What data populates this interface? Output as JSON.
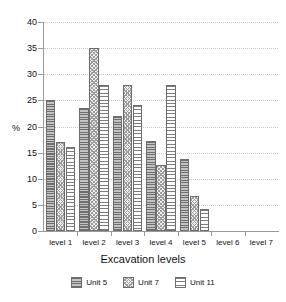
{
  "chart_data": {
    "type": "bar",
    "title": "",
    "subtitle": "",
    "xlabel": "Excavation levels",
    "ylabel": "%",
    "categories": [
      "level 1",
      "level 2",
      "level 3",
      "level 4",
      "level 5",
      "level 6",
      "level 7"
    ],
    "series": [
      {
        "name": "Unit 5",
        "values": [
          25.1,
          23.6,
          22.1,
          17.2,
          13.7,
          0,
          0
        ],
        "pattern": "dark-horizontal-lines",
        "color": "#8c8c8c"
      },
      {
        "name": "Unit 7",
        "values": [
          17.0,
          35.0,
          28.0,
          12.7,
          6.7,
          0,
          0
        ],
        "pattern": "light-checker",
        "color": "#e0e0e0"
      },
      {
        "name": "Unit 11",
        "values": [
          16.1,
          28.0,
          24.2,
          28.0,
          4.2,
          0,
          0
        ],
        "pattern": "thin-horizontal-lines",
        "color": "#ffffff"
      }
    ],
    "ylim": [
      0,
      40
    ],
    "yticks": [
      0,
      5,
      10,
      15,
      20,
      25,
      30,
      35,
      40
    ],
    "ytick_labels": [
      "0",
      "5",
      "10",
      "15",
      "20",
      "25",
      "30",
      "35",
      "40"
    ],
    "grid": true,
    "grid_axis": "y",
    "grid_style": "dotted",
    "legend_position": "bottom",
    "legend_entries": [
      "Unit 5",
      "Unit 7",
      "Unit 11"
    ]
  }
}
